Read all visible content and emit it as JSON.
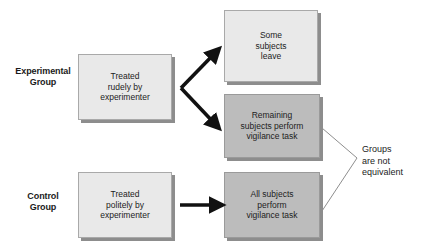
{
  "diagram": {
    "labels": {
      "experimental_group": "Experimental\nGroup",
      "control_group": "Control\nGroup"
    },
    "boxes": {
      "treated_rudely": "Treated\nrudely by\nexperimenter",
      "treated_politely": "Treated\npolitely by\nexperimenter",
      "some_leave": "Some\nsubjects\nleave",
      "remaining_perform": "Remaining\nsubjects perform\nvigilance task",
      "all_perform": "All subjects\nperform\nvigilance task"
    },
    "annotation": {
      "groups_not_equivalent": "Groups\nare not\nequivalent"
    },
    "colors": {
      "light_box_fill": "#e9e9e9",
      "dark_box_fill": "#bcbcbc",
      "box_border": "#a9a9a9",
      "box_shadow": "#8d8d8d",
      "arrow": "#111111",
      "bracket_line": "#8e8e8e",
      "text": "#1c1c1c",
      "background": "#ffffff"
    },
    "arrows": {
      "split_up": "branch arrow from Treated rudely to Some subjects leave",
      "split_down": "branch arrow from Treated rudely to Remaining subjects perform vigilance task",
      "control_straight": "arrow from Treated politely to All subjects perform vigilance task",
      "comparison_bracket": "bracket joining the two vigilance-task boxes"
    }
  }
}
